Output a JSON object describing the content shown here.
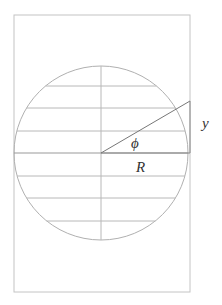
{
  "diagram": {
    "type": "geometry-figure",
    "colors": {
      "stroke": "#b8b8b8",
      "radius_stroke": "#777777",
      "text": "#333333"
    },
    "rectangle": {
      "x": 14,
      "y": 15,
      "width": 176,
      "height": 277
    },
    "circle": {
      "cx": 101,
      "cy": 153,
      "r": 87
    },
    "vertical_axis": {
      "x": 101,
      "y1": 66,
      "y2": 240
    },
    "chords_y": [
      86,
      108,
      131,
      153,
      176,
      198,
      221
    ],
    "radius_line": {
      "x1": 101,
      "y1": 153,
      "x2": 190,
      "y2": 101
    },
    "height_segment": {
      "x": 190,
      "y1": 101,
      "y2": 153
    },
    "labels": {
      "phi": "ϕ",
      "R": "R",
      "y": "y"
    }
  }
}
